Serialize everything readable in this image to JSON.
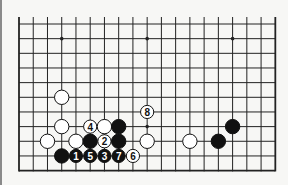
{
  "diagram": {
    "type": "go-board-diagram",
    "board_size": 19,
    "visible_rows": 11,
    "visible_cols": 19,
    "origin": "bottom-edge-visible, top-edge-open",
    "colors": {
      "background": "#f7f7f5",
      "grid": "#222222",
      "black_stone": "#111111",
      "white_stone": "#ffffff",
      "stone_outline": "#111111"
    },
    "star_points": [
      {
        "col": 3,
        "row": 1
      },
      {
        "col": 9,
        "row": 1
      },
      {
        "col": 15,
        "row": 1
      },
      {
        "col": 9,
        "row": 7
      },
      {
        "col": 15,
        "row": 7
      }
    ],
    "stones": [
      {
        "color": "white",
        "col": 3,
        "row": 5,
        "label": ""
      },
      {
        "color": "white",
        "col": 3,
        "row": 7,
        "label": ""
      },
      {
        "color": "white",
        "col": 5,
        "row": 7,
        "label": "4"
      },
      {
        "color": "white",
        "col": 6,
        "row": 7,
        "label": ""
      },
      {
        "color": "black",
        "col": 7,
        "row": 7,
        "label": ""
      },
      {
        "color": "white",
        "col": 9,
        "row": 6,
        "label": "8"
      },
      {
        "color": "black",
        "col": 15,
        "row": 7,
        "label": ""
      },
      {
        "color": "white",
        "col": 2,
        "row": 8,
        "label": ""
      },
      {
        "color": "white",
        "col": 4,
        "row": 8,
        "label": ""
      },
      {
        "color": "black",
        "col": 5,
        "row": 8,
        "label": ""
      },
      {
        "color": "white",
        "col": 6,
        "row": 8,
        "label": "2"
      },
      {
        "color": "black",
        "col": 7,
        "row": 8,
        "label": ""
      },
      {
        "color": "white",
        "col": 9,
        "row": 8,
        "label": ""
      },
      {
        "color": "white",
        "col": 12,
        "row": 8,
        "label": ""
      },
      {
        "color": "black",
        "col": 14,
        "row": 8,
        "label": ""
      },
      {
        "color": "black",
        "col": 3,
        "row": 9,
        "label": ""
      },
      {
        "color": "black",
        "col": 4,
        "row": 9,
        "label": "1"
      },
      {
        "color": "black",
        "col": 5,
        "row": 9,
        "label": "5"
      },
      {
        "color": "black",
        "col": 6,
        "row": 9,
        "label": "3"
      },
      {
        "color": "black",
        "col": 7,
        "row": 9,
        "label": "7"
      },
      {
        "color": "white",
        "col": 8,
        "row": 9,
        "label": "6"
      }
    ]
  }
}
